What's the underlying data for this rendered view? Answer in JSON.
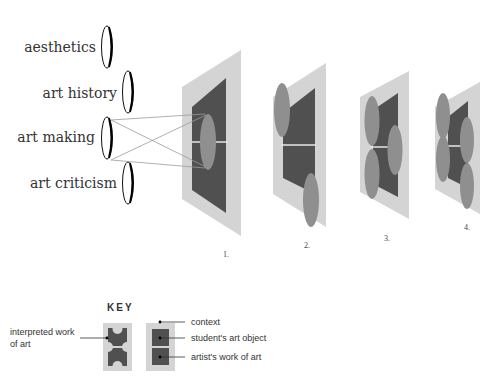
{
  "lenses": [
    {
      "label": "aesthetics"
    },
    {
      "label": "art history"
    },
    {
      "label": "art making"
    },
    {
      "label": "art criticism"
    }
  ],
  "figures": [
    {
      "number": "1."
    },
    {
      "number": "2."
    },
    {
      "number": "3."
    },
    {
      "number": "4."
    }
  ],
  "key": {
    "title": "KEY",
    "interpreted_label_line1": "interpreted work",
    "interpreted_label_line2": "of art",
    "context_label": "context",
    "student_label": "student's art object",
    "artist_label": "artist's work of art"
  },
  "colors": {
    "context": "#d4d4d4",
    "artwork": "#505050",
    "interpretation": "#8f8f8f",
    "divider": "#e6e6e6"
  }
}
